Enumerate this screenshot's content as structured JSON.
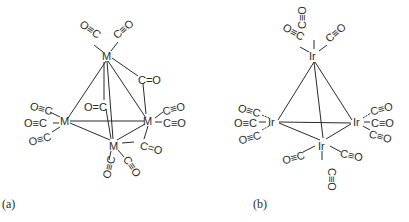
{
  "figure": {
    "panels": [
      {
        "id": "a",
        "caption": "(a)",
        "metal_symbol": "M",
        "description": "M4(CO)12 tetrahedral cluster with three bridging carbonyls",
        "metals": [
          {
            "id": "M1",
            "label": "M",
            "position": "top"
          },
          {
            "id": "M2",
            "label": "M",
            "position": "left"
          },
          {
            "id": "M3",
            "label": "M",
            "position": "right"
          },
          {
            "id": "M4",
            "label": "M",
            "position": "bottom"
          }
        ],
        "terminal_co": [
          {
            "metal": "M1",
            "label": "O≡C",
            "side": "upper-left"
          },
          {
            "metal": "M1",
            "label": "C≡O",
            "side": "upper-right"
          },
          {
            "metal": "M2",
            "label": "O≡C",
            "side": "upper-left"
          },
          {
            "metal": "M2",
            "label": "O≡C",
            "side": "left"
          },
          {
            "metal": "M2",
            "label": "O≡C",
            "side": "lower-left"
          },
          {
            "metal": "M3",
            "label": "C≡O",
            "side": "upper-right"
          },
          {
            "metal": "M3",
            "label": "C≡O",
            "side": "right"
          },
          {
            "metal": "M4",
            "label": "O≡C",
            "side": "lower-left"
          },
          {
            "metal": "M4",
            "label": "C≡O",
            "side": "lower-right"
          }
        ],
        "bridging_co": [
          {
            "between": [
              "M1",
              "M3"
            ],
            "label": "C=O"
          },
          {
            "between": [
              "M1",
              "M4"
            ],
            "label": "O=C"
          },
          {
            "between": [
              "M3",
              "M4"
            ],
            "label": "C=O"
          }
        ]
      },
      {
        "id": "b",
        "caption": "(b)",
        "metal_symbol": "Ir",
        "description": "Ir4(CO)12 tetrahedral cluster with all-terminal carbonyls",
        "metals": [
          {
            "id": "Ir1",
            "label": "Ir",
            "position": "top"
          },
          {
            "id": "Ir2",
            "label": "Ir",
            "position": "left"
          },
          {
            "id": "Ir3",
            "label": "Ir",
            "position": "right"
          },
          {
            "id": "Ir4",
            "label": "Ir",
            "position": "bottom"
          }
        ],
        "terminal_co": [
          {
            "metal": "Ir1",
            "label": "O≡C",
            "side": "upper-left"
          },
          {
            "metal": "Ir1",
            "label": "C≡O",
            "side": "up"
          },
          {
            "metal": "Ir1",
            "label": "C≡O",
            "side": "upper-right"
          },
          {
            "metal": "Ir2",
            "label": "O≡C",
            "side": "upper-left"
          },
          {
            "metal": "Ir2",
            "label": "O≡C",
            "side": "left"
          },
          {
            "metal": "Ir2",
            "label": "O≡C",
            "side": "lower-left"
          },
          {
            "metal": "Ir3",
            "label": "C≡O",
            "side": "upper-right"
          },
          {
            "metal": "Ir3",
            "label": "C≡O",
            "side": "right"
          },
          {
            "metal": "Ir3",
            "label": "C≡O",
            "side": "lower-right"
          },
          {
            "metal": "Ir4",
            "label": "O≡C",
            "side": "left"
          },
          {
            "metal": "Ir4",
            "label": "C≡O",
            "side": "right"
          },
          {
            "metal": "Ir4",
            "label": "C≡O",
            "side": "down"
          }
        ]
      }
    ]
  }
}
